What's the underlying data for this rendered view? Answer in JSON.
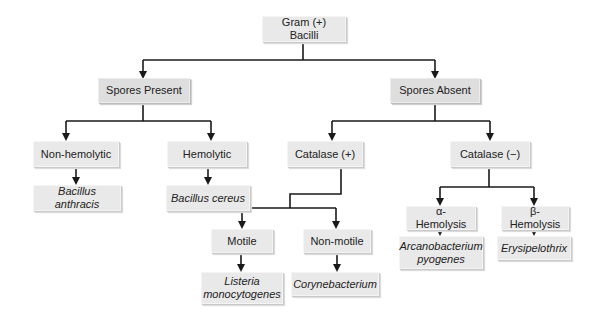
{
  "diagram": {
    "root": {
      "label": "Gram (+) Bacilli"
    },
    "spores_present": {
      "label": "Spores Present",
      "non_hemolytic": {
        "label": "Non-hemolytic",
        "organism": "Bacillus anthracis"
      },
      "hemolytic": {
        "label": "Hemolytic",
        "organism": "Bacillus cereus"
      }
    },
    "spores_absent": {
      "label": "Spores Absent",
      "catalase_pos": {
        "label": "Catalase (+)",
        "motile": {
          "label": "Motile",
          "organism_line1": "Listeria",
          "organism_line2": "monocytogenes"
        },
        "non_motile": {
          "label": "Non-motile",
          "organism": "Corynebacterium"
        }
      },
      "catalase_neg": {
        "label": "Catalase (−)",
        "alpha": {
          "label": "α-Hemolysis",
          "organism_line1": "Arcanobacterium",
          "organism_line2": "pyogenes"
        },
        "beta": {
          "label": "β-Hemolysis",
          "organism": "Erysipelothrix"
        }
      }
    },
    "colors": {
      "line": "#1a1a1a",
      "box_fill": "#e9e9e9",
      "text": "#222222"
    }
  }
}
